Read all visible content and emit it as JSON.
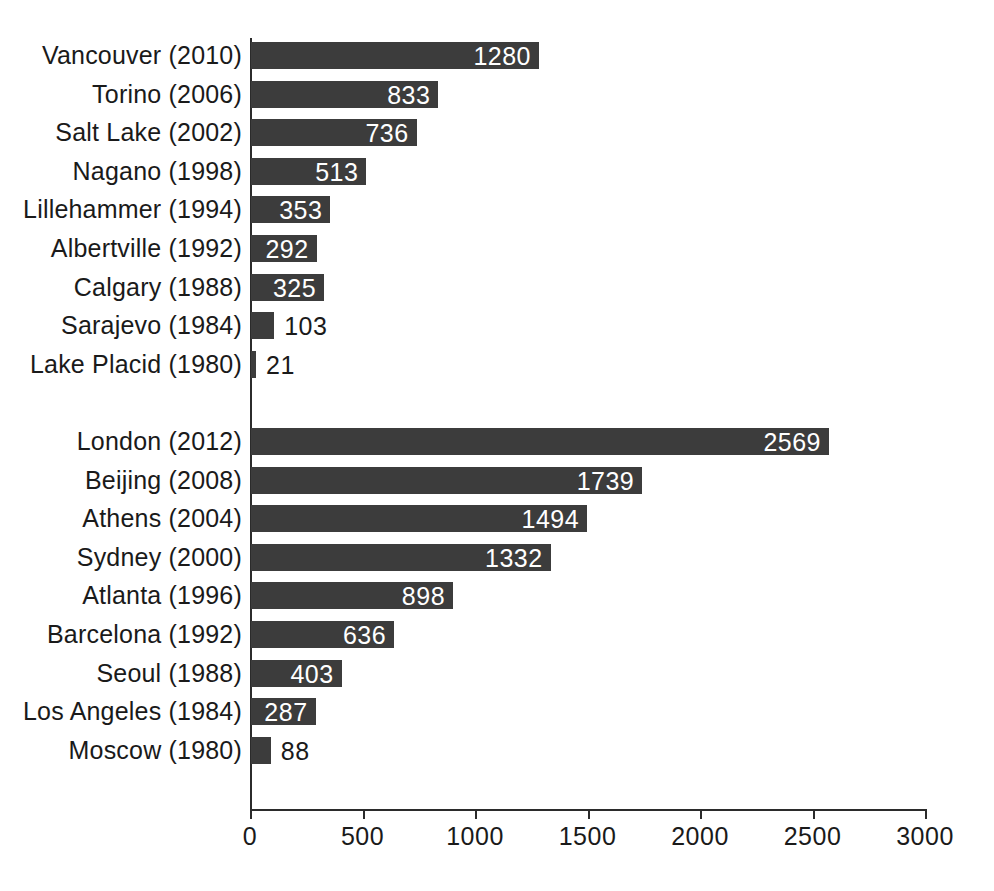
{
  "chart_data": {
    "type": "bar",
    "orientation": "horizontal",
    "title": "",
    "subtitle": "",
    "xlabel": "",
    "ylabel": "",
    "xlim": [
      0,
      3000
    ],
    "ylim": null,
    "grid": false,
    "legend": null,
    "bar_color": "#3c3c3c",
    "axis_color": "#2b2b2b",
    "inside_label_color": "#ffffff",
    "outside_label_color": "#1a1a1a",
    "xticks": [
      0,
      500,
      1000,
      1500,
      2000,
      2500,
      3000
    ],
    "xtick_labels": [
      "0",
      "500",
      "1000",
      "1500",
      "2000",
      "2500",
      "3000"
    ],
    "groups": [
      {
        "name": "winter-olympics",
        "categories": [
          "Vancouver (2010)",
          "Torino (2006)",
          "Salt Lake (2002)",
          "Nagano (1998)",
          "Lillehammer (1994)",
          "Albertville (1992)",
          "Calgary (1988)",
          "Sarajevo (1984)",
          "Lake Placid (1980)"
        ],
        "values": [
          1280,
          833,
          736,
          513,
          353,
          292,
          325,
          103,
          21
        ]
      },
      {
        "name": "summer-olympics",
        "categories": [
          "London (2012)",
          "Beijing (2008)",
          "Athens (2004)",
          "Sydney (2000)",
          "Atlanta (1996)",
          "Barcelona (1992)",
          "Seoul (1988)",
          "Los Angeles (1984)",
          "Moscow (1980)"
        ],
        "values": [
          2569,
          1739,
          1494,
          1332,
          898,
          636,
          403,
          287,
          88
        ]
      }
    ],
    "categories": [
      "Vancouver (2010)",
      "Torino (2006)",
      "Salt Lake (2002)",
      "Nagano (1998)",
      "Lillehammer (1994)",
      "Albertville (1992)",
      "Calgary (1988)",
      "Sarajevo (1984)",
      "Lake Placid (1980)",
      "London (2012)",
      "Beijing (2008)",
      "Athens (2004)",
      "Sydney (2000)",
      "Atlanta (1996)",
      "Barcelona (1992)",
      "Seoul (1988)",
      "Los Angeles (1984)",
      "Moscow (1980)"
    ],
    "values": [
      1280,
      833,
      736,
      513,
      353,
      292,
      325,
      103,
      21,
      2569,
      1739,
      1494,
      1332,
      898,
      636,
      403,
      287,
      88
    ],
    "value_labels": [
      "1280",
      "833",
      "736",
      "513",
      "353",
      "292",
      "325",
      "103",
      "21",
      "2569",
      "1739",
      "1494",
      "1332",
      "898",
      "636",
      "403",
      "287",
      "88"
    ]
  }
}
